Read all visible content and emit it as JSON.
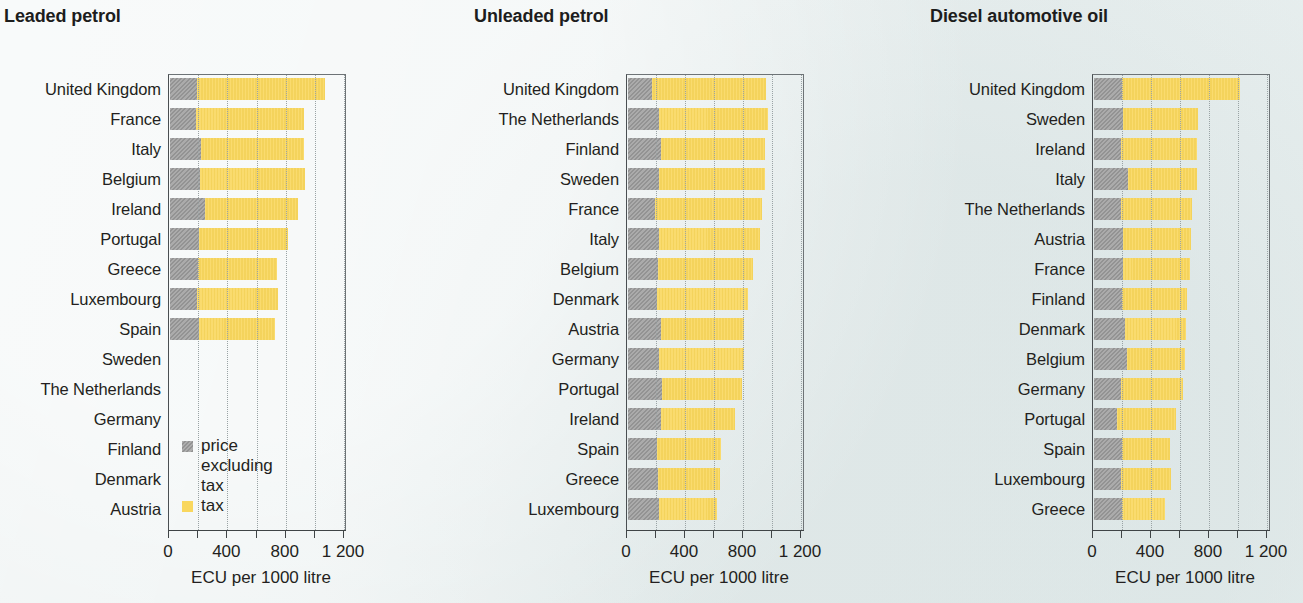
{
  "colors": {
    "background": "#eaf0f0",
    "price_excluding_tax": "#9b9b9b",
    "tax": "#f9d75e",
    "axis": "#3f4446",
    "text": "#231f20"
  },
  "legend": {
    "price_label": "price\nexcluding tax",
    "tax_label": "tax"
  },
  "axis": {
    "caption": "ECU per 1000 litre",
    "ticks": [
      {
        "value": 0,
        "label": "0"
      },
      {
        "value": 200,
        "label": ""
      },
      {
        "value": 400,
        "label": "400"
      },
      {
        "value": 600,
        "label": ""
      },
      {
        "value": 800,
        "label": "800"
      },
      {
        "value": 1000,
        "label": ""
      },
      {
        "value": 1200,
        "label": "1 200"
      }
    ],
    "min": 0,
    "max": 1250
  },
  "chart_data": [
    {
      "type": "bar",
      "orientation": "horizontal",
      "stacked": true,
      "title": "Leaded petrol",
      "xlabel": "ECU per 1000 litre",
      "ylabel": "",
      "xlim": [
        0,
        1250
      ],
      "grid": true,
      "legend_position": "inside-lower-left",
      "categories": [
        "United Kingdom",
        "France",
        "Italy",
        "Belgium",
        "Ireland",
        "Portugal",
        "Greece",
        "Luxembourg",
        "Spain",
        "Sweden",
        "The Netherlands",
        "Germany",
        "Finland",
        "Denmark",
        "Austria"
      ],
      "series": [
        {
          "name": "price excluding tax",
          "values": [
            185,
            180,
            215,
            210,
            240,
            200,
            195,
            190,
            200,
            null,
            null,
            null,
            null,
            null,
            null
          ]
        },
        {
          "name": "tax",
          "values": [
            880,
            740,
            710,
            720,
            640,
            615,
            540,
            555,
            520,
            null,
            null,
            null,
            null,
            null,
            null
          ]
        }
      ],
      "totals": [
        1065,
        920,
        925,
        930,
        880,
        815,
        735,
        745,
        720,
        null,
        null,
        null,
        null,
        null,
        null
      ]
    },
    {
      "type": "bar",
      "orientation": "horizontal",
      "stacked": true,
      "title": "Unleaded petrol",
      "xlabel": "ECU per 1000 litre",
      "ylabel": "",
      "xlim": [
        0,
        1250
      ],
      "grid": true,
      "legend_position": "none",
      "categories": [
        "United Kingdom",
        "The Netherlands",
        "Finland",
        "Sweden",
        "France",
        "Italy",
        "Belgium",
        "Denmark",
        "Austria",
        "Germany",
        "Portugal",
        "Ireland",
        "Spain",
        "Greece",
        "Luxembourg"
      ],
      "series": [
        {
          "name": "price excluding tax",
          "values": [
            170,
            220,
            230,
            215,
            190,
            220,
            210,
            205,
            230,
            215,
            235,
            230,
            205,
            210,
            215
          ]
        },
        {
          "name": "tax",
          "values": [
            785,
            745,
            720,
            735,
            740,
            690,
            655,
            625,
            570,
            585,
            555,
            510,
            440,
            425,
            400
          ]
        }
      ],
      "totals": [
        955,
        965,
        950,
        950,
        930,
        910,
        865,
        830,
        800,
        800,
        790,
        740,
        645,
        635,
        615
      ]
    },
    {
      "type": "bar",
      "orientation": "horizontal",
      "stacked": true,
      "title": "Diesel automotive oil",
      "xlabel": "ECU per 1000 litre",
      "ylabel": "",
      "xlim": [
        0,
        1250
      ],
      "grid": true,
      "legend_position": "none",
      "categories": [
        "United Kingdom",
        "Sweden",
        "Ireland",
        "Italy",
        "The Netherlands",
        "Austria",
        "France",
        "Finland",
        "Denmark",
        "Belgium",
        "Germany",
        "Portugal",
        "Spain",
        "Luxembourg",
        "Greece"
      ],
      "series": [
        {
          "name": "price excluding tax",
          "values": [
            195,
            200,
            190,
            235,
            190,
            200,
            205,
            195,
            220,
            230,
            190,
            160,
            195,
            190,
            195
          ]
        },
        {
          "name": "tax",
          "values": [
            815,
            520,
            520,
            480,
            490,
            470,
            460,
            450,
            420,
            400,
            430,
            410,
            335,
            345,
            300
          ]
        }
      ],
      "totals": [
        1010,
        720,
        710,
        715,
        680,
        670,
        665,
        645,
        640,
        630,
        620,
        570,
        530,
        535,
        495
      ]
    }
  ]
}
